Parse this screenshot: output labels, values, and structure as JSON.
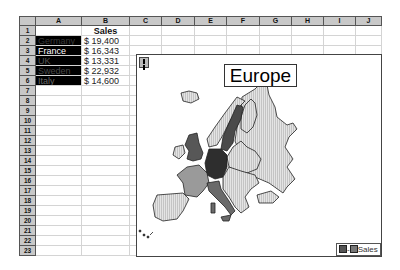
{
  "spreadsheet": {
    "columns": [
      "A",
      "B",
      "C",
      "D",
      "E",
      "F",
      "G",
      "H",
      "I",
      "J"
    ],
    "rows": [
      "1",
      "2",
      "3",
      "4",
      "5",
      "6",
      "7",
      "8",
      "9",
      "10",
      "11",
      "12",
      "13",
      "14",
      "15",
      "16",
      "17",
      "18",
      "19",
      "20",
      "21",
      "22",
      "23"
    ],
    "header_cell": {
      "ref": "B1",
      "value": "Sales"
    },
    "data": [
      {
        "country": "Germany",
        "sales": "$ 19,400"
      },
      {
        "country": "France",
        "sales": "$ 16,343"
      },
      {
        "country": "UK",
        "sales": "$ 13,331"
      },
      {
        "country": "Sweden",
        "sales": "$ 22,932"
      },
      {
        "country": "Italy",
        "sales": "$ 14,600"
      }
    ]
  },
  "map_chart": {
    "title": "Europe",
    "legend": {
      "label": "Sales",
      "low_color": "#555555",
      "high_color": "#777777"
    },
    "shading": {
      "Sweden": "#4a4a4a",
      "Germany": "#2e2e2e",
      "UK": "#575757",
      "Italy": "#6a6a6a",
      "France": "#9a9a9a",
      "other": "#d8d8d8"
    }
  }
}
